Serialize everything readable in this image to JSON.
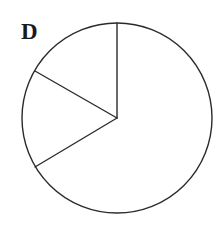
{
  "figure": {
    "label": "D",
    "label_position": {
      "x": 21,
      "y": 20
    },
    "background_color": "#ffffff",
    "stroke_color": "#2b2b2b",
    "stroke_width": 1.4,
    "fill_color": "#ffffff",
    "circle": {
      "cx": 117,
      "cy": 118,
      "r": 95
    },
    "radii": [
      {
        "name": "radius-top",
        "angle_deg": 90,
        "endpoint": {
          "x": 117,
          "y": 23
        }
      },
      {
        "name": "radius-upper-left",
        "angle_deg": 150,
        "endpoint": {
          "x": 35,
          "y": 71
        }
      },
      {
        "name": "radius-lower-left",
        "angle_deg": 211,
        "endpoint": {
          "x": 35,
          "y": 167
        }
      }
    ]
  },
  "chart_data": {
    "type": "pie",
    "title": "D",
    "xlabel": "",
    "ylabel": "",
    "categories": [
      "sector-1",
      "sector-2",
      "sector-3"
    ],
    "values": [
      60,
      61,
      239
    ],
    "units": "degrees",
    "legend": "none",
    "grid": false,
    "labels_shown": false,
    "slices": [
      {
        "name": "sector-1",
        "start_angle_deg": 90,
        "end_angle_deg": 150,
        "sweep_deg": 60,
        "fraction": 0.167,
        "fill": "#ffffff"
      },
      {
        "name": "sector-2",
        "start_angle_deg": 150,
        "end_angle_deg": 211,
        "sweep_deg": 61,
        "fraction": 0.169,
        "fill": "#ffffff"
      },
      {
        "name": "sector-3",
        "start_angle_deg": 211,
        "end_angle_deg": 450,
        "sweep_deg": 239,
        "fraction": 0.664,
        "fill": "#ffffff"
      }
    ]
  }
}
